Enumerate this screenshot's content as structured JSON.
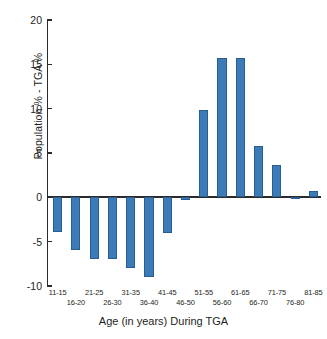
{
  "chart_data": {
    "type": "bar",
    "title": "",
    "xlabel": "Age (in years) During TGA",
    "ylabel": "Population % - TGA %",
    "categories": [
      "11-15",
      "16-20",
      "21-25",
      "26-30",
      "31-35",
      "36-40",
      "41-45",
      "46-50",
      "51-55",
      "56-60",
      "61-65",
      "66-70",
      "71-75",
      "76-80",
      "81-85"
    ],
    "values": [
      -3.9,
      -5.9,
      -6.9,
      -6.9,
      -8.0,
      -9.0,
      -4.0,
      -0.3,
      9.9,
      15.7,
      15.7,
      5.8,
      3.7,
      -0.2,
      0.7
    ],
    "ylim": [
      -10,
      20
    ],
    "yticks": [
      20,
      15,
      10,
      5,
      0,
      -5,
      -10
    ],
    "ytick_labels": [
      "20",
      "15",
      "10",
      "5",
      "0",
      "-5",
      "-10"
    ],
    "grid": false,
    "legend": null,
    "bar_color": "#3b7cb8",
    "axis_color": "#2b2b2b",
    "zero_line": 0
  },
  "caption_remnant": ""
}
